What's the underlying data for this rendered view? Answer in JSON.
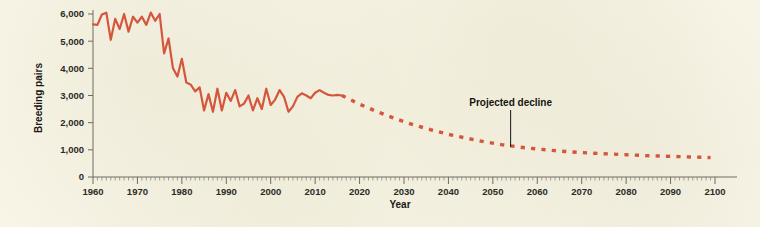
{
  "chart_data": {
    "type": "line",
    "title": "",
    "xlabel": "Year",
    "ylabel": "Breeding pairs",
    "xlim": [
      1960,
      2101
    ],
    "ylim": [
      0,
      6500
    ],
    "grid": false,
    "legend": "none",
    "y_ticks": [
      0,
      1000,
      2000,
      3000,
      4000,
      5000,
      6000
    ],
    "y_tick_labels": [
      "0",
      "1,000",
      "2,000",
      "3,000",
      "4,000",
      "5,000",
      "6,000"
    ],
    "x_ticks": [
      1960,
      1970,
      1980,
      1990,
      2000,
      2010,
      2020,
      2030,
      2040,
      2050,
      2060,
      2070,
      2080,
      2090,
      2100
    ],
    "x_tick_labels": [
      "1960",
      "1970",
      "1980",
      "1990",
      "2000",
      "2010",
      "2020",
      "2030",
      "2040",
      "2050",
      "2060",
      "2070",
      "2080",
      "2090",
      "2100"
    ],
    "x_minor_tick_step": 1,
    "series": [
      {
        "name": "Observed breeding pairs",
        "style": "solid",
        "color": "#d4563c",
        "x": [
          1960,
          1961,
          1962,
          1963,
          1964,
          1965,
          1966,
          1967,
          1968,
          1969,
          1970,
          1971,
          1972,
          1973,
          1974,
          1975,
          1976,
          1977,
          1978,
          1979,
          1980,
          1981,
          1982,
          1983,
          1984,
          1985,
          1986,
          1987,
          1988,
          1989,
          1990,
          1991,
          1992,
          1993,
          1994,
          1995,
          1996,
          1997,
          1998,
          1999,
          2000,
          2001,
          2002,
          2003,
          2004,
          2005,
          2006,
          2007,
          2008,
          2009,
          2010,
          2011,
          2012,
          2013,
          2014,
          2015,
          2016
        ],
        "values": [
          5620,
          5600,
          5980,
          6050,
          5050,
          5820,
          5450,
          6000,
          5350,
          5900,
          5680,
          5900,
          5600,
          6050,
          5750,
          6000,
          4550,
          5100,
          4000,
          3700,
          4350,
          3480,
          3400,
          3150,
          3300,
          2450,
          3050,
          2400,
          3250,
          2450,
          3100,
          2800,
          3200,
          2600,
          2700,
          3000,
          2450,
          2900,
          2500,
          3250,
          2650,
          2850,
          3200,
          2950,
          2400,
          2600,
          2950,
          3080,
          3000,
          2900,
          3100,
          3200,
          3100,
          3020,
          3000,
          3020,
          3000
        ]
      },
      {
        "name": "Projected decline",
        "style": "dashed",
        "color": "#d4563c",
        "x": [
          2016,
          2020,
          2024,
          2028,
          2032,
          2036,
          2040,
          2044,
          2048,
          2052,
          2056,
          2060,
          2064,
          2068,
          2072,
          2076,
          2080,
          2084,
          2088,
          2092,
          2096,
          2099
        ],
        "values": [
          3000,
          2680,
          2400,
          2150,
          1930,
          1740,
          1570,
          1430,
          1300,
          1190,
          1100,
          1030,
          970,
          920,
          880,
          850,
          820,
          790,
          770,
          750,
          730,
          715
        ]
      }
    ],
    "annotations": [
      {
        "label": "Projected decline",
        "x": 2054,
        "y": 1140,
        "label_offset_y": -40
      }
    ]
  },
  "style": {
    "background": "#faf7ea",
    "line_color": "#d4563c",
    "axis_color": "#6f6c60",
    "text_color": "#15140f"
  }
}
